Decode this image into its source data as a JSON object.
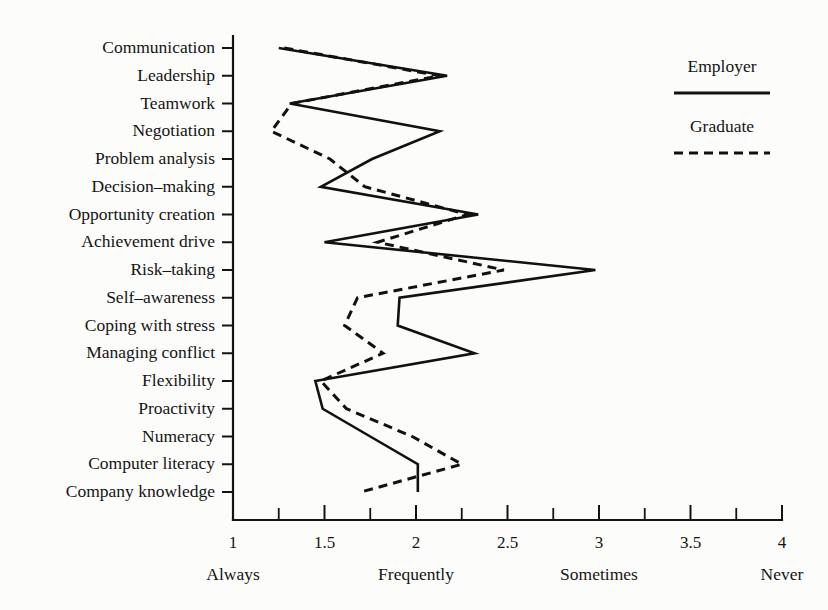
{
  "chart_data": {
    "type": "line",
    "title": "",
    "xlabel": "",
    "ylabel": "",
    "orientation": "horizontal",
    "xlim": [
      1,
      4
    ],
    "grid": false,
    "legend_position": "top-right",
    "xticks": [
      1,
      1.5,
      2,
      2.5,
      3,
      3.5,
      4
    ],
    "xticklabels": [
      "1",
      "1.5",
      "2",
      "2.5",
      "3",
      "3.5",
      "4"
    ],
    "xtick_minor_step": 0.25,
    "scale_words": [
      {
        "label": "Always",
        "value": 1
      },
      {
        "label": "Frequently",
        "value": 2
      },
      {
        "label": "Sometimes",
        "value": 3
      },
      {
        "label": "Never",
        "value": 4
      }
    ],
    "categories": [
      "Communication",
      "Leadership",
      "Teamwork",
      "Negotiation",
      "Problem analysis",
      "Decision–making",
      "Opportunity creation",
      "Achievement drive",
      "Risk–taking",
      "Self–awareness",
      "Coping with stress",
      "Managing conflict",
      "Flexibility",
      "Proactivity",
      "Numeracy",
      "Computer literacy",
      "Company knowledge"
    ],
    "series": [
      {
        "name": "Employer",
        "style": "solid",
        "values": [
          1.25,
          2.17,
          1.31,
          2.13,
          1.76,
          1.48,
          2.34,
          1.5,
          2.98,
          1.91,
          1.9,
          2.32,
          1.45,
          1.49,
          1.75,
          2.01,
          2.01
        ]
      },
      {
        "name": "Graduate",
        "style": "dashed",
        "values": [
          1.28,
          2.13,
          1.32,
          1.21,
          1.53,
          1.72,
          2.28,
          1.79,
          2.48,
          1.68,
          1.61,
          1.82,
          1.48,
          1.62,
          1.98,
          2.25,
          1.7
        ]
      }
    ]
  },
  "legend": {
    "entries": [
      {
        "label": "Employer",
        "style": "solid"
      },
      {
        "label": "Graduate",
        "style": "dashed"
      }
    ]
  }
}
